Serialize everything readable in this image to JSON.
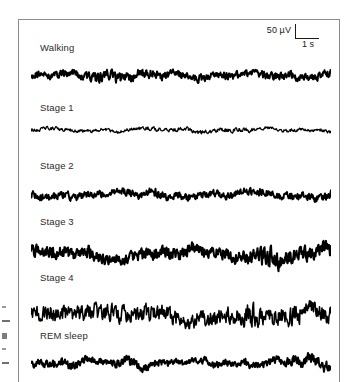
{
  "figure": {
    "type": "eeg-traces",
    "background_color": "#ffffff",
    "trace_color": "#000000",
    "border_color": "#8c8c8c"
  },
  "scale_bar": {
    "name": "calibration-scale-bar",
    "amplitude_label": "50 µV",
    "time_label": "1 s",
    "amplitude_value": 50,
    "amplitude_unit": "µV",
    "time_value": 1,
    "time_unit": "s"
  },
  "traces": [
    {
      "label": "Walking",
      "amplitude": 9.5,
      "density": 2.05,
      "thickness": 2.0,
      "roughness": 0.92,
      "seed": 11
    },
    {
      "label": "Stage 1",
      "amplitude": 5.2,
      "density": 1.7,
      "thickness": 1.25,
      "roughness": 0.72,
      "seed": 27
    },
    {
      "label": "Stage 2",
      "amplitude": 10.5,
      "density": 1.55,
      "thickness": 1.9,
      "roughness": 0.8,
      "seed": 43
    },
    {
      "label": "Stage 3",
      "amplitude": 13.5,
      "density": 1.3,
      "thickness": 2.1,
      "roughness": 1.05,
      "seed": 58
    },
    {
      "label": "Stage 4",
      "amplitude": 16.5,
      "density": 0.62,
      "thickness": 1.55,
      "roughness": 1.15,
      "seed": 71
    },
    {
      "label": "REM sleep",
      "amplitude": 9.0,
      "density": 2.0,
      "thickness": 2.0,
      "roughness": 0.9,
      "seed": 86
    }
  ],
  "caption_fragments": {
    "name": "cropped-caption-marks",
    "visible": true,
    "count": 5
  }
}
